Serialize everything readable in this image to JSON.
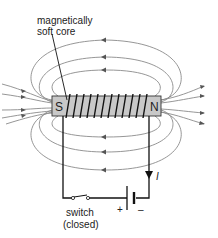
{
  "diagram": {
    "labels": {
      "core_label_line1": "magnetically",
      "core_label_line2": "soft core",
      "south_pole": "S",
      "north_pole": "N",
      "current": "I",
      "switch_line1": "switch",
      "switch_line2": "(closed)",
      "battery_plus": "+",
      "battery_minus": "–"
    },
    "colors": {
      "core_fill": "#c8c8c8",
      "core_stroke": "#333333",
      "field_lines": "#8a8a8a",
      "wire": "#111111",
      "background": "#ffffff"
    },
    "components": [
      "soft iron core",
      "coil winding",
      "magnetic field lines",
      "switch",
      "battery",
      "current arrow"
    ],
    "field_direction": "Field lines exit N pole (right) and loop back to enter S pole (left)",
    "coil_turns_visible": 11
  }
}
